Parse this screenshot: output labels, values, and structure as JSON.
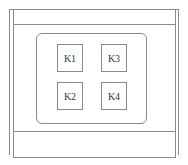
{
  "diagram": {
    "type": "keypad-panel",
    "colors": {
      "stroke": "#8a8a8a",
      "text": "#333333",
      "background": "#ffffff"
    },
    "keys": [
      {
        "label": "K1",
        "row": 1,
        "col": 1
      },
      {
        "label": "K3",
        "row": 1,
        "col": 2
      },
      {
        "label": "K2",
        "row": 2,
        "col": 1
      },
      {
        "label": "K4",
        "row": 2,
        "col": 2
      }
    ]
  }
}
